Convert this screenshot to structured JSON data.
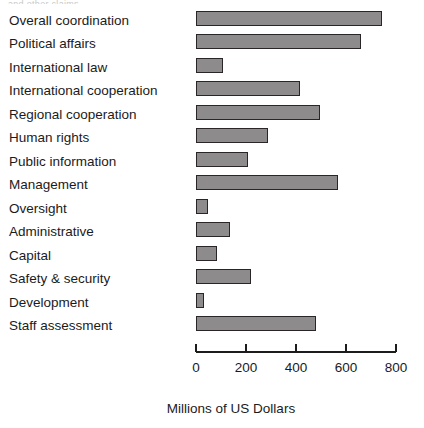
{
  "artifact_text": "and other claims",
  "chart_data": {
    "type": "bar",
    "orientation": "horizontal",
    "title": "",
    "xlabel": "Millions of US Dollars",
    "ylabel": "",
    "xlim": [
      0,
      800
    ],
    "xticks": [
      0,
      200,
      400,
      600,
      800
    ],
    "xtick_labels": [
      "0",
      "200",
      "400",
      "600",
      "800"
    ],
    "grid": false,
    "legend": false,
    "bar_color": "#8d8b8c",
    "bar_edge_color": "#2a2628",
    "categories": [
      "Overall coordination",
      "Political affairs",
      "International law",
      "International cooperation",
      "Regional cooperation",
      "Human rights",
      "Public information",
      "Management",
      "Oversight",
      "Administrative",
      "Capital",
      "Safety & security",
      "Development",
      "Staff assessment"
    ],
    "values": [
      745,
      660,
      108,
      416,
      496,
      288,
      208,
      568,
      48,
      136,
      84,
      220,
      32,
      480
    ]
  }
}
